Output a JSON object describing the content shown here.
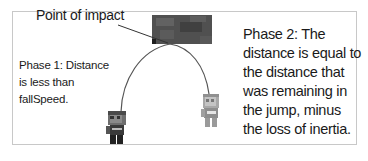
{
  "diagram": {
    "labels": {
      "point_of_impact": "Point of impact",
      "phase1": "Phase 1:  Distance is less than fallSpeed.",
      "phase2": "Phase 2:  The distance is equal to the distance that was remaining in the jump, minus the loss of inertia."
    },
    "elements": {
      "impact_block": "dark textured ceiling block",
      "character_left": "pixel character standing (dark)",
      "character_right": "pixel character faded (light)",
      "trajectory": "jump arc"
    },
    "colors": {
      "border": "#c8c8c8",
      "text": "#1a1a1a",
      "block": "#4a4a4a",
      "arc": "#555555"
    }
  }
}
